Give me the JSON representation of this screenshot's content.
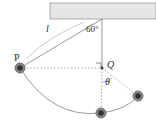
{
  "figure": {
    "type": "physics-diagram",
    "width": 156,
    "height": 127,
    "background_color": "#ffffff",
    "labels": {
      "pivot_angle": "60°",
      "string_length": "l",
      "point_p": "P",
      "point_q": "Q",
      "swing_angle": "θ"
    },
    "colors": {
      "ceiling_fill": "#e2e2e2",
      "ceiling_stroke": "#8e8e8e",
      "line": "#8c8c8c",
      "dotted": "#a8a8a8",
      "bob_outer": "#6d6d6d",
      "bob_inner": "#3a3a3a",
      "text": "#2b2b2b"
    },
    "geometry": {
      "ceiling": {
        "x": 50,
        "y": 3,
        "width": 106,
        "height": 16
      },
      "pivot": {
        "x": 102,
        "y": 19
      },
      "bob_p": {
        "x": 20,
        "y": 68,
        "r": 5
      },
      "point_q": {
        "x": 102,
        "y": 68
      },
      "bob_bottom": {
        "x": 101,
        "y": 113,
        "r": 5
      },
      "bob_right": {
        "x": 138,
        "y": 96,
        "r": 5
      },
      "right_angle_marker": {
        "x": 97,
        "y": 63,
        "size": 5
      }
    }
  }
}
